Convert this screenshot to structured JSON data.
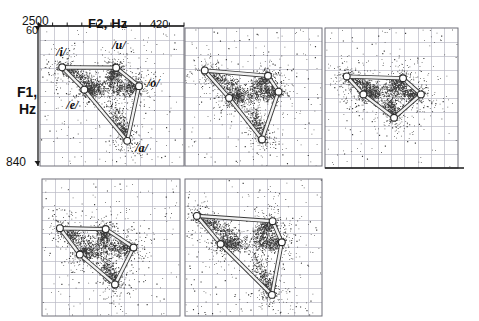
{
  "figure": {
    "title": "",
    "axes": {
      "x_label": "F2, Hz",
      "x_max_left": "2500",
      "x_min_right": "420",
      "y_label_line1": "F1,",
      "y_label_line2": "Hz",
      "y_top": "60",
      "y_bottom": "840"
    },
    "vowel_labels": [
      "/i/",
      "/u/",
      "/o/",
      "/e/",
      "/a/"
    ],
    "colors": {
      "scatter": "#2b2b2b",
      "grid": "#b9b9c4",
      "axis": "#1a1a1a",
      "polygon_line": "#f2f2f2",
      "polygon_line_edge": "#3a3a3a",
      "vertex_fill": "#ffffff",
      "vertex_edge": "#2a2a2a",
      "panel_border": "#6e6e78",
      "background": "#ffffff"
    }
  },
  "chart_data": {
    "type": "scatter",
    "title": "",
    "xlabel": "F2, Hz",
    "ylabel": "F1, Hz",
    "xlim": [
      2500,
      420
    ],
    "ylim": [
      840,
      60
    ],
    "x_axis_direction": "reversed (2500 Hz at left, 420 Hz at right)",
    "y_axis_direction": "reversed (60 Hz at top, 840 Hz at bottom)",
    "grid": true,
    "legend": "none",
    "annotations": [
      "/i/",
      "/u/",
      "/o/",
      "/e/",
      "/a/"
    ],
    "panels": [
      {
        "index": 1,
        "row": 1,
        "col": 1,
        "labelled": true,
        "n_points": 2600,
        "vowel_vertices": [
          {
            "vowel": "/i/",
            "F2": 2180,
            "F1": 290,
            "label_dx": -6,
            "label_dy": -14
          },
          {
            "vowel": "/e/",
            "F2": 1860,
            "F1": 415,
            "label_dx": -18,
            "label_dy": 16
          },
          {
            "vowel": "/a/",
            "F2": 1240,
            "F1": 700,
            "label_dx": 8,
            "label_dy": 8
          },
          {
            "vowel": "/o/",
            "F2": 1070,
            "F1": 395,
            "label_dx": 8,
            "label_dy": -2
          },
          {
            "vowel": "/u/",
            "F2": 1400,
            "F1": 292,
            "label_dx": -4,
            "label_dy": -22
          }
        ],
        "polygon_order": [
          "/i/",
          "/u/",
          "/o/",
          "/a/",
          "/e/"
        ]
      },
      {
        "index": 2,
        "row": 1,
        "col": 2,
        "labelled": false,
        "n_points": 2400,
        "vowel_vertices": [
          {
            "vowel": "/i/",
            "F2": 2200,
            "F1": 300
          },
          {
            "vowel": "/e/",
            "F2": 1830,
            "F1": 455
          },
          {
            "vowel": "/a/",
            "F2": 1330,
            "F1": 690
          },
          {
            "vowel": "/o/",
            "F2": 1080,
            "F1": 420
          },
          {
            "vowel": "/u/",
            "F2": 1240,
            "F1": 330
          }
        ],
        "polygon_order": [
          "/i/",
          "/u/",
          "/o/",
          "/a/",
          "/e/"
        ]
      },
      {
        "index": 3,
        "row": 1,
        "col": 3,
        "labelled": false,
        "n_points": 2500,
        "vowel_vertices": [
          {
            "vowel": "/i/",
            "F2": 2160,
            "F1": 330
          },
          {
            "vowel": "/e/",
            "F2": 1900,
            "F1": 430
          },
          {
            "vowel": "/a/",
            "F2": 1420,
            "F1": 560
          },
          {
            "vowel": "/o/",
            "F2": 1000,
            "F1": 430
          },
          {
            "vowel": "/u/",
            "F2": 1280,
            "F1": 340
          }
        ],
        "polygon_order": [
          "/i/",
          "/u/",
          "/o/",
          "/a/",
          "/e/"
        ]
      },
      {
        "index": 4,
        "row": 2,
        "col": 1,
        "labelled": false,
        "n_points": 2500,
        "vowel_vertices": [
          {
            "vowel": "/i/",
            "F2": 2230,
            "F1": 340
          },
          {
            "vowel": "/e/",
            "F2": 1930,
            "F1": 490
          },
          {
            "vowel": "/a/",
            "F2": 1400,
            "F1": 660
          },
          {
            "vowel": "/o/",
            "F2": 1120,
            "F1": 450
          },
          {
            "vowel": "/u/",
            "F2": 1540,
            "F1": 345
          }
        ],
        "polygon_order": [
          "/i/",
          "/u/",
          "/o/",
          "/a/",
          "/e/"
        ]
      },
      {
        "index": 5,
        "row": 2,
        "col": 2,
        "labelled": false,
        "n_points": 2700,
        "vowel_vertices": [
          {
            "vowel": "/i/",
            "F2": 2320,
            "F1": 270
          },
          {
            "vowel": "/e/",
            "F2": 1960,
            "F1": 430
          },
          {
            "vowel": "/a/",
            "F2": 1180,
            "F1": 720
          },
          {
            "vowel": "/o/",
            "F2": 1030,
            "F1": 420
          },
          {
            "vowel": "/u/",
            "F2": 1170,
            "F1": 300
          }
        ],
        "polygon_order": [
          "/i/",
          "/u/",
          "/o/",
          "/a/",
          "/e/"
        ]
      }
    ]
  }
}
